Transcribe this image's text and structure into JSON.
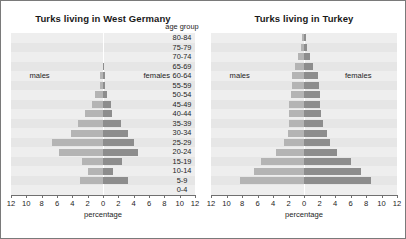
{
  "figure": {
    "age_axis_title": "age group",
    "age_groups": [
      "80-84",
      "75-79",
      "70-74",
      "65-69",
      "60-64",
      "55-59",
      "50-54",
      "45-49",
      "40-44",
      "35-39",
      "30-34",
      "25-29",
      "20-24",
      "15-19",
      "10-14",
      "5-9",
      "0-4"
    ],
    "xlabel": "percentage",
    "tick_labels": [
      "12",
      "10",
      "8",
      "6",
      "4",
      "2",
      "0",
      "2",
      "4",
      "6",
      "8",
      "10",
      "12"
    ],
    "male_label": "males",
    "female_label": "females",
    "colors": {
      "male_bar": "#b4b4b4",
      "female_bar": "#8d8d8d",
      "band_odd": "#eeeeee",
      "band_even": "#e6e6e6",
      "border": "#7a7a7a",
      "text": "#1d1d1d"
    }
  },
  "chart_data": [
    {
      "type": "bar",
      "subtype": "population-pyramid",
      "title": "Turks living in West Germany",
      "xlabel": "percentage",
      "ylabel": "age group",
      "xlim": [
        -12,
        12
      ],
      "xticks": [
        -12,
        -10,
        -8,
        -6,
        -4,
        -2,
        0,
        2,
        4,
        6,
        8,
        10,
        12
      ],
      "xticklabels": [
        "12",
        "10",
        "8",
        "6",
        "4",
        "2",
        "0",
        "2",
        "4",
        "6",
        "8",
        "10",
        "12"
      ],
      "categories": [
        "80-84",
        "75-79",
        "70-74",
        "65-69",
        "60-64",
        "55-59",
        "50-54",
        "45-49",
        "40-44",
        "35-39",
        "30-34",
        "25-29",
        "20-24",
        "15-19",
        "10-14",
        "5-9",
        "0-4"
      ],
      "grid": false,
      "legend_position": "inside-upper",
      "series": [
        {
          "name": "males",
          "values": [
            0.0,
            0.0,
            0.0,
            0.05,
            0.4,
            0.4,
            1.1,
            1.5,
            2.4,
            3.3,
            4.2,
            6.6,
            5.8,
            2.7,
            1.9,
            3.0,
            0.0
          ]
        },
        {
          "name": "females",
          "values": [
            0.0,
            0.0,
            0.0,
            0.05,
            0.3,
            0.3,
            0.5,
            1.0,
            1.2,
            2.4,
            3.2,
            4.1,
            4.5,
            2.5,
            1.3,
            3.2,
            0.0
          ]
        }
      ]
    },
    {
      "type": "bar",
      "subtype": "population-pyramid",
      "title": "Turks living in Turkey",
      "xlabel": "percentage",
      "ylabel": "age group",
      "xlim": [
        -12,
        12
      ],
      "xticks": [
        -12,
        -10,
        -8,
        -6,
        -4,
        -2,
        0,
        2,
        4,
        6,
        8,
        10,
        12
      ],
      "xticklabels": [
        "12",
        "10",
        "8",
        "6",
        "4",
        "2",
        "0",
        "2",
        "4",
        "6",
        "8",
        "10",
        "12"
      ],
      "categories": [
        "80-84",
        "75-79",
        "70-74",
        "65-69",
        "60-64",
        "55-59",
        "50-54",
        "45-49",
        "40-44",
        "35-39",
        "30-34",
        "25-29",
        "20-24",
        "15-19",
        "10-14",
        "5-9",
        "0-4"
      ],
      "grid": false,
      "legend_position": "inside-upper",
      "series": [
        {
          "name": "males",
          "values": [
            0.3,
            0.4,
            0.8,
            1.1,
            1.5,
            1.6,
            1.7,
            1.9,
            2.0,
            2.0,
            2.1,
            2.6,
            3.6,
            5.5,
            6.5,
            8.3,
            0.0
          ]
        },
        {
          "name": "females",
          "values": [
            0.3,
            0.4,
            0.8,
            1.1,
            1.8,
            1.9,
            2.0,
            2.1,
            2.2,
            2.5,
            3.0,
            3.4,
            4.2,
            6.0,
            7.3,
            8.7,
            0.0
          ]
        }
      ]
    }
  ]
}
